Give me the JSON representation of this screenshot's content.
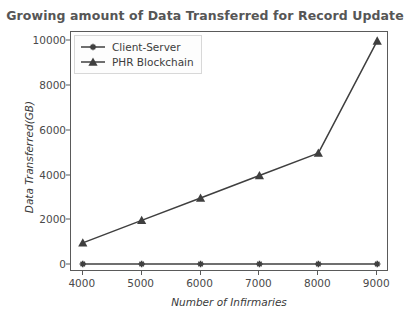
{
  "chart_data": {
    "type": "line",
    "title": "Growing amount of Data Transferred for Record Update",
    "xlabel": "Number of Infirmaries",
    "ylabel": "Data Transferred(GB)",
    "x": [
      4000,
      5000,
      6000,
      7000,
      8000,
      9000
    ],
    "xtick_labels": [
      "4000",
      "5000",
      "6000",
      "7000",
      "8000",
      "9000"
    ],
    "ytick_labels": [
      "0",
      "2000",
      "4000",
      "6000",
      "8000",
      "10000"
    ],
    "yticks": [
      0,
      2000,
      4000,
      6000,
      8000,
      10000
    ],
    "xlim": [
      3800,
      9200
    ],
    "ylim": [
      -300,
      10400
    ],
    "grid": false,
    "legend_position": "upper left",
    "series": [
      {
        "name": "Client-Server",
        "marker": "star",
        "color": "#3f3f3f",
        "values": [
          60,
          60,
          60,
          60,
          60,
          60
        ]
      },
      {
        "name": "PHR Blockchain",
        "marker": "triangle",
        "color": "#3f3f3f",
        "values": [
          1000,
          2000,
          3000,
          4000,
          5000,
          10000
        ]
      }
    ]
  },
  "colors": {
    "title": "#565656",
    "axis": "#5a5a5a",
    "line": "#3f3f3f",
    "background": "#ffffff"
  }
}
